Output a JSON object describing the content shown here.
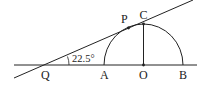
{
  "diagram": {
    "type": "geometry",
    "labels": {
      "Q": "Q",
      "A": "A",
      "O": "O",
      "B": "B",
      "C": "C",
      "P": "P"
    },
    "angle_label": "22.5°",
    "stroke_color": "#222222",
    "elements": [
      {
        "kind": "line",
        "name": "baseline",
        "through": [
          "Q",
          "A",
          "O",
          "B"
        ]
      },
      {
        "kind": "line",
        "name": "tangent-line",
        "through": [
          "Q",
          "P"
        ]
      },
      {
        "kind": "semicircle",
        "name": "semicircle-AB",
        "center": "O",
        "diameter": [
          "A",
          "B"
        ]
      },
      {
        "kind": "segment",
        "name": "segment-OC",
        "from": "O",
        "to": "C"
      },
      {
        "kind": "angle",
        "name": "angle-PQA",
        "vertex": "Q",
        "value": "22.5°"
      }
    ]
  }
}
